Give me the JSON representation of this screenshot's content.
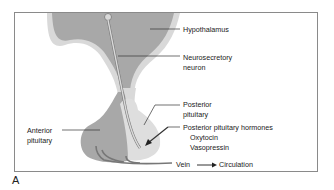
{
  "figure": {
    "panel_label": "A",
    "labels": {
      "hypothalamus": "Hypothalamus",
      "neurosecretory_line1": "Neurosecretory",
      "neurosecretory_line2": "neuron",
      "posterior_line1": "Posterior",
      "posterior_line2": "pituitary",
      "anterior_line1": "Anterior",
      "anterior_line2": "pituitary",
      "hormones_title": "Posterior pituitary hormones",
      "hormone_1": "Oxytocin",
      "hormone_2": "Vasopressin",
      "vein": "Vein",
      "circulation": "Circulation"
    },
    "colors": {
      "dark_tissue": "#a8a8a8",
      "light_tissue": "#d9d9d9",
      "outline": "#8a8a8a",
      "text": "#222222"
    }
  }
}
